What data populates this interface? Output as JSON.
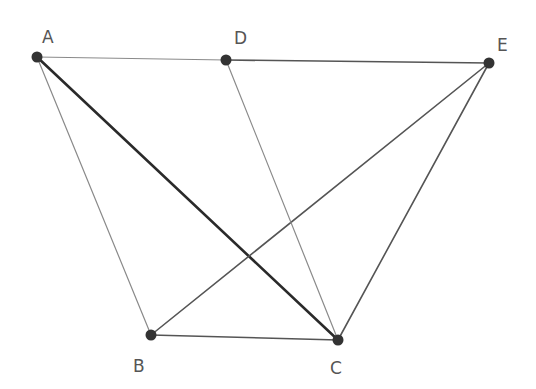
{
  "diagram": {
    "points": [
      {
        "id": "A",
        "label": "A"
      },
      {
        "id": "B",
        "label": "B"
      },
      {
        "id": "C",
        "label": "C"
      },
      {
        "id": "D",
        "label": "D"
      },
      {
        "id": "E",
        "label": "E"
      }
    ],
    "segments": [
      {
        "from": "A",
        "to": "D",
        "style": "thin"
      },
      {
        "from": "D",
        "to": "E",
        "style": "medium"
      },
      {
        "from": "A",
        "to": "B",
        "style": "thin"
      },
      {
        "from": "A",
        "to": "C",
        "style": "thick"
      },
      {
        "from": "B",
        "to": "C",
        "style": "medium"
      },
      {
        "from": "B",
        "to": "E",
        "style": "medium"
      },
      {
        "from": "D",
        "to": "C",
        "style": "thin"
      },
      {
        "from": "E",
        "to": "C",
        "style": "medium"
      }
    ],
    "colors": {
      "thin": "#8a8a8a",
      "medium": "#555555",
      "thick": "#2a2a2a",
      "point": "#333333"
    }
  }
}
